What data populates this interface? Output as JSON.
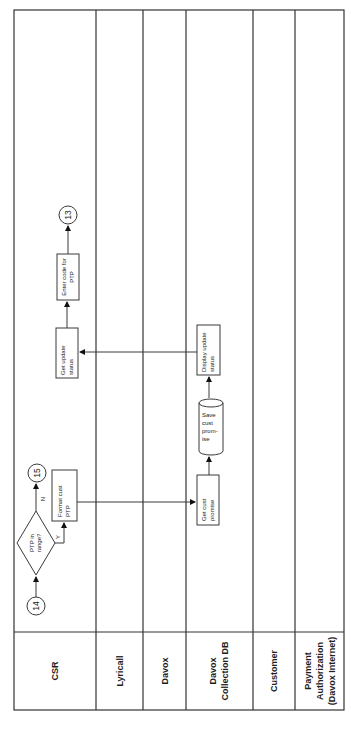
{
  "diagram": {
    "type": "swimlane-flowchart",
    "orientation": "rotated-90-ccw",
    "colors": {
      "line": "#333333",
      "text": "#222222",
      "background": "#ffffff"
    },
    "lanes": [
      {
        "id": "csr",
        "label": "CSR"
      },
      {
        "id": "lyricall",
        "label": "Lyricall"
      },
      {
        "id": "davox",
        "label": "Davox"
      },
      {
        "id": "davox-db",
        "label_line1": "Davox",
        "label_line2": "Collection DB"
      },
      {
        "id": "customer",
        "label": "Customer"
      },
      {
        "id": "payment",
        "label_line1": "Payment",
        "label_line2": "Authorization",
        "label_line3": "(Davox Internet)"
      }
    ],
    "connectors": {
      "start": "14",
      "no_branch": "15",
      "end": "13"
    },
    "decision": {
      "line1": "PTP in",
      "line2": "range?",
      "yes_label": "Y",
      "no_label": "N"
    },
    "processes": {
      "format_cust_ptp": {
        "line1": "Format cust",
        "line2": "PTP"
      },
      "get_cust_promise": {
        "line1": "Get cust",
        "line2": "promise"
      },
      "save_cust_promise": {
        "line1": "Save",
        "line2": "cust",
        "line3": "prom-",
        "line4": "ise"
      },
      "display_update_status": {
        "line1": "Display  update",
        "line2": "status"
      },
      "get_update_status": {
        "line1": "Get update",
        "line2": "status"
      },
      "enter_code_for_ptp": {
        "line1": "Enter code for",
        "line2": "PTP"
      }
    }
  }
}
